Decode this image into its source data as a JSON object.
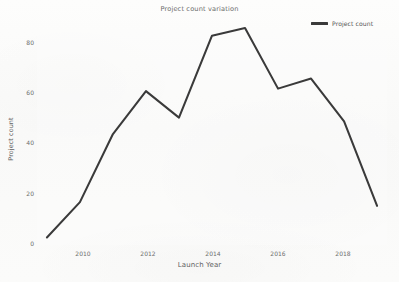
{
  "chart_data": {
    "type": "line",
    "title": "Project count variation",
    "xlabel": "Launch Year",
    "ylabel": "Project count",
    "x": [
      2009,
      2010,
      2011,
      2012,
      2013,
      2014,
      2015,
      2016,
      2017,
      2018,
      2019
    ],
    "series": [
      {
        "name": "Project count",
        "color": "#3a3a3a",
        "values": [
          1,
          15,
          42,
          59,
          48.5,
          81,
          84,
          60,
          64,
          47,
          13.5
        ]
      }
    ],
    "xlim": [
      2008.7,
      2019.3
    ],
    "ylim": [
      -2,
      88
    ],
    "xticks": [
      2010,
      2012,
      2014,
      2016,
      2018
    ],
    "xtick_labels": [
      "2010",
      "2012",
      "2014",
      "2016",
      "2018"
    ],
    "yticks": [
      0,
      20,
      40,
      60,
      80
    ],
    "ytick_labels": [
      "0",
      "20",
      "40",
      "60",
      "80"
    ],
    "grid": false,
    "legend": {
      "position": "top-right",
      "entries": [
        {
          "label": "Project count",
          "color": "#3a3a3a",
          "marker": "line"
        }
      ]
    },
    "background_color": "#fcfcfb",
    "text_color": "#6a6a6a"
  }
}
